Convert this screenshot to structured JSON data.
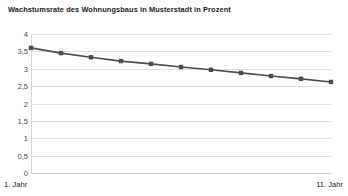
{
  "chart_data": {
    "type": "line",
    "title": "Wachstumsrate des Wohnungsbaus in Musterstadt in Prozent",
    "xlabel": "",
    "ylabel": "",
    "x": [
      1,
      2,
      3,
      4,
      5,
      6,
      7,
      8,
      9,
      10,
      11
    ],
    "x_tick_labels": [
      "1. Jahr",
      "11. Jahr"
    ],
    "categories": [
      "1. Jahr",
      "2. Jahr",
      "3. Jahr",
      "4. Jahr",
      "5. Jahr",
      "6. Jahr",
      "7. Jahr",
      "8. Jahr",
      "9. Jahr",
      "10. Jahr",
      "11. Jahr"
    ],
    "values": [
      3.6,
      3.45,
      3.33,
      3.22,
      3.14,
      3.05,
      2.97,
      2.88,
      2.79,
      2.71,
      2.62
    ],
    "ylim": [
      0,
      4
    ],
    "ytick_values": [
      4,
      3.5,
      3,
      2.5,
      2,
      1.5,
      1,
      0.5,
      0
    ],
    "ytick_labels": [
      "4",
      "3,5",
      "3",
      "2,5",
      "2",
      "1,5",
      "1",
      "0,5",
      "0"
    ],
    "grid": true,
    "legend": false,
    "series_color": "#4d4d4d",
    "marker": "square",
    "grid_color": "#dededf",
    "background_color": "#ffffff"
  }
}
